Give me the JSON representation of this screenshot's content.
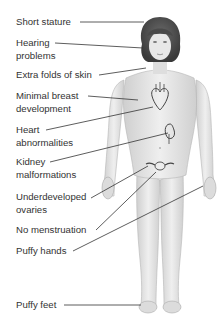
{
  "diagram": {
    "type": "anatomical-callout",
    "line_color": "#333333",
    "text_color": "#333333",
    "skin_color": "#e6e6e6",
    "hair_color": "#4a4a4a",
    "labels": [
      {
        "id": "short-stature",
        "lines": [
          "Short stature"
        ],
        "x": 16,
        "y": 16
      },
      {
        "id": "hearing-problems",
        "lines": [
          "Hearing",
          "problems"
        ],
        "x": 16,
        "y": 37
      },
      {
        "id": "extra-folds-of-skin",
        "lines": [
          "Extra folds of skin"
        ],
        "x": 16,
        "y": 69
      },
      {
        "id": "minimal-breast-development",
        "lines": [
          "Minimal breast",
          "development"
        ],
        "x": 16,
        "y": 90
      },
      {
        "id": "heart-abnormalities",
        "lines": [
          "Heart",
          "abnormalities"
        ],
        "x": 16,
        "y": 124
      },
      {
        "id": "kidney-malformations",
        "lines": [
          "Kidney",
          "malformations"
        ],
        "x": 16,
        "y": 156
      },
      {
        "id": "underdeveloped-ovaries",
        "lines": [
          "Underdeveloped",
          "ovaries"
        ],
        "x": 16,
        "y": 191
      },
      {
        "id": "no-menstruation",
        "lines": [
          "No menstruation"
        ],
        "x": 16,
        "y": 224
      },
      {
        "id": "puffy-hands",
        "lines": [
          "Puffy hands"
        ],
        "x": 16,
        "y": 245
      },
      {
        "id": "puffy-feet",
        "lines": [
          "Puffy feet"
        ],
        "x": 16,
        "y": 299
      }
    ]
  }
}
